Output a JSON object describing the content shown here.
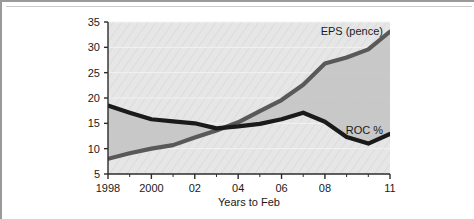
{
  "chart_data": {
    "type": "line",
    "title": "",
    "xlabel": "Years to Feb",
    "ylabel": "",
    "xlim": [
      1998,
      2011
    ],
    "ylim": [
      5,
      35
    ],
    "grid": true,
    "legend_position": "inline-annotation",
    "x": [
      1998,
      1999,
      2000,
      2001,
      2002,
      2003,
      2004,
      2005,
      2006,
      2007,
      2008,
      2009,
      2010,
      2011
    ],
    "xtick_values": [
      1998,
      2000,
      2002,
      2004,
      2006,
      2008,
      2011
    ],
    "xtick_labels": [
      "1998",
      "2000",
      "02",
      "04",
      "06",
      "08",
      "11"
    ],
    "ytick_values": [
      5,
      10,
      15,
      20,
      25,
      30,
      35
    ],
    "ytick_labels": [
      "5",
      "10",
      "15",
      "20",
      "25",
      "30",
      "35"
    ],
    "series": [
      {
        "name": "EPS (pence)",
        "label": "EPS (pence)",
        "color": "#595959",
        "values": [
          8.0,
          9.1,
          10.0,
          10.7,
          12.2,
          13.6,
          15.2,
          17.4,
          19.6,
          22.6,
          26.8,
          28.0,
          29.6,
          33.1
        ]
      },
      {
        "name": "ROC %",
        "label": "ROC %",
        "color": "#1a1a1a",
        "values": [
          18.5,
          17.1,
          15.8,
          15.4,
          15.0,
          14.0,
          14.4,
          14.9,
          15.8,
          17.1,
          15.3,
          12.3,
          11.0,
          12.9
        ]
      }
    ],
    "annotations": [
      {
        "text": "EPS (pence)",
        "series": "EPS (pence)"
      },
      {
        "text": "ROC %",
        "series": "ROC %"
      }
    ],
    "plot_background": "#e3e3e3",
    "fill_between_color": "#c6c6c6"
  }
}
